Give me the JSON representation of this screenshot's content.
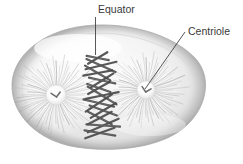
{
  "figure": {
    "background_color": "#ffffff",
    "width": 243,
    "height": 164
  },
  "labels": [
    {
      "id": "equator",
      "text": "Equator",
      "text_x": 98,
      "text_y": 13,
      "leader": {
        "x1": 95.5,
        "y1": 17,
        "x2": 95.5,
        "y2": 55
      },
      "color": "#3a3a3a"
    },
    {
      "id": "centriole",
      "text": "Centriole",
      "text_x": 188,
      "text_y": 35,
      "leader": {
        "x1": 185,
        "y1": 32,
        "x2": 145,
        "y2": 89
      },
      "color": "#3a3a3a"
    }
  ],
  "cell": {
    "name": "animal-cell-membrane",
    "fill_light": "#fbfbfb",
    "fill_mid": "#ececec",
    "fill_dark": "#c9c9c9",
    "outline_color": "#b4b4b4",
    "center_x": 108,
    "center_y": 88,
    "radius_x": 98,
    "radius_y": 61
  },
  "asters": [
    {
      "id": "left-aster",
      "center_x": 56,
      "center_y": 95,
      "ray_length": 40,
      "ray_count": 64,
      "hub_radius": 10,
      "color": "#8e8e8e"
    },
    {
      "id": "right-aster",
      "center_x": 146,
      "center_y": 90,
      "ray_length": 38,
      "ray_count": 64,
      "hub_radius": 9,
      "color": "#8e8e8e"
    }
  ],
  "centrioles": [
    {
      "id": "left-centriole",
      "x": 56,
      "y": 95,
      "color": "#6b6b6b"
    },
    {
      "id": "right-centriole",
      "x": 146,
      "y": 90,
      "color": "#6b6b6b"
    }
  ],
  "chromosomes": {
    "name": "metaphase-chromosome-plate",
    "color": "#4a4a4a",
    "count": 11,
    "plate_x": 101,
    "plate_top": 58,
    "plate_bottom": 133,
    "plate_half_width": 17
  },
  "colors": {
    "ink": "#3a3a3a",
    "chromosome": "#4a4a4a",
    "spindle": "#8e8e8e",
    "membrane": "#b4b4b4",
    "background": "#ffffff"
  }
}
